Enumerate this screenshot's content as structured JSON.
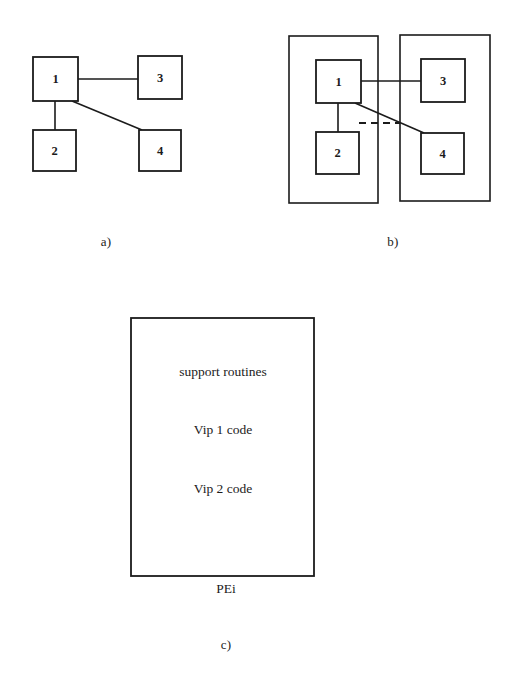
{
  "figure": {
    "background_color": "#ffffff",
    "ink_color": "#1b1b1b",
    "panels": [
      {
        "id": "a",
        "label": "a)",
        "label_pos": {
          "x": 106,
          "y": 242
        },
        "description": "task graph of four nodes",
        "nodes": [
          {
            "id": "n1",
            "text": "1",
            "x": 33,
            "y": 57,
            "w": 45,
            "h": 44
          },
          {
            "id": "n3",
            "text": "3",
            "x": 138,
            "y": 56,
            "w": 44,
            "h": 43
          },
          {
            "id": "n2",
            "text": "2",
            "x": 33,
            "y": 130,
            "w": 43,
            "h": 41
          },
          {
            "id": "n4",
            "text": "4",
            "x": 139,
            "y": 130,
            "w": 42,
            "h": 41
          }
        ],
        "edges": [
          {
            "from": "n1",
            "to": "n3",
            "style": "solid"
          },
          {
            "from": "n1",
            "to": "n2",
            "style": "solid"
          },
          {
            "from": "n1",
            "to": "n4",
            "style": "solid"
          }
        ]
      },
      {
        "id": "b",
        "label": "b)",
        "label_pos": {
          "x": 393,
          "y": 242
        },
        "description": "same graph partitioned into two processing elements with a cut edge",
        "containers": [
          {
            "id": "pe-left",
            "x": 289,
            "y": 36,
            "w": 89,
            "h": 167
          },
          {
            "id": "pe-right",
            "x": 400,
            "y": 35,
            "w": 90,
            "h": 166
          }
        ],
        "nodes": [
          {
            "id": "n1",
            "text": "1",
            "x": 316,
            "y": 60,
            "w": 45,
            "h": 43
          },
          {
            "id": "n3",
            "text": "3",
            "x": 421,
            "y": 59,
            "w": 44,
            "h": 43
          },
          {
            "id": "n2",
            "text": "2",
            "x": 316,
            "y": 132,
            "w": 43,
            "h": 42
          },
          {
            "id": "n4",
            "text": "4",
            "x": 421,
            "y": 133,
            "w": 43,
            "h": 41
          }
        ],
        "edges": [
          {
            "from": "n1",
            "to": "n3",
            "style": "solid"
          },
          {
            "from": "n1",
            "to": "n2",
            "style": "solid"
          },
          {
            "from": "n1",
            "to": "n4",
            "style": "solid"
          }
        ],
        "cut_marker": {
          "style": "dashed",
          "x1": 359,
          "y1": 123,
          "x2": 400,
          "y2": 123
        }
      },
      {
        "id": "c",
        "label": "c)",
        "label_pos": {
          "x": 226,
          "y": 645
        },
        "description": "memory image of a processing element",
        "box": {
          "x": 131,
          "y": 318,
          "w": 183,
          "h": 258
        },
        "contents": [
          {
            "text": "support routines",
            "cx": 223,
            "cy": 372
          },
          {
            "text": "Vip 1 code",
            "cx": 223,
            "cy": 430
          },
          {
            "text": "Vip 2 code",
            "cx": 223,
            "cy": 489
          }
        ],
        "caption": {
          "text": "PEi",
          "cx": 226,
          "cy": 589
        }
      }
    ]
  }
}
